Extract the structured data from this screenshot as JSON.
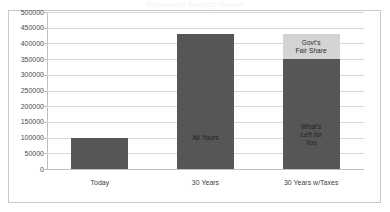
{
  "chart_data": {
    "type": "bar",
    "title": "Retirement Savings Growth",
    "xlabel": "",
    "ylabel": "",
    "ylim": [
      0,
      500000
    ],
    "ytick_step": 50000,
    "yticks": [
      500000,
      450000,
      400000,
      350000,
      300000,
      250000,
      200000,
      150000,
      100000,
      50000,
      0
    ],
    "ytick_labels": [
      "500000",
      "450000",
      "400000",
      "350000",
      "300000",
      "250000",
      "200000",
      "150000",
      "100000",
      "50000",
      "0"
    ],
    "categories": [
      "Today",
      "30 Years",
      "30 Years w/Taxes"
    ],
    "grid": "horizontal",
    "legend": "none",
    "stacked": true,
    "series": [
      {
        "name": "What's Left for You",
        "color": "#565656",
        "values": [
          100000,
          430000,
          350000
        ]
      },
      {
        "name": "Govt's Fair Share",
        "color": "#d4d4d4",
        "values": [
          0,
          0,
          80000
        ]
      }
    ],
    "bars": [
      {
        "category": "Today",
        "total": 100000,
        "segments": [
          {
            "label": "",
            "value": 100000,
            "color": "#565656"
          }
        ]
      },
      {
        "category": "30 Years",
        "total": 430000,
        "segments": [
          {
            "label": "All Yours",
            "value": 430000,
            "color": "#565656"
          }
        ]
      },
      {
        "category": "30 Years w/Taxes",
        "total": 430000,
        "segments": [
          {
            "label": "What's\nLeft for\nYou",
            "value": 350000,
            "color": "#565656"
          },
          {
            "label": "Govt's\nFair Share",
            "value": 80000,
            "color": "#d4d4d4"
          }
        ]
      }
    ],
    "annotations": [
      {
        "text": "All Yours",
        "bar": "30 Years"
      },
      {
        "text": "What's\nLeft for\nYou",
        "bar": "30 Years w/Taxes"
      },
      {
        "text": "Govt's\nFair Share",
        "bar": "30 Years w/Taxes"
      }
    ],
    "colors": {
      "bar_dark": "#565616",
      "bar_dark_actual": "#565656",
      "bar_light": "#d4d4d4",
      "gridline": "#d9d9d9",
      "frame_border": "#c8c8c8",
      "axis": "#bfbfbf",
      "background": "#ffffff",
      "text": "#404040"
    }
  }
}
